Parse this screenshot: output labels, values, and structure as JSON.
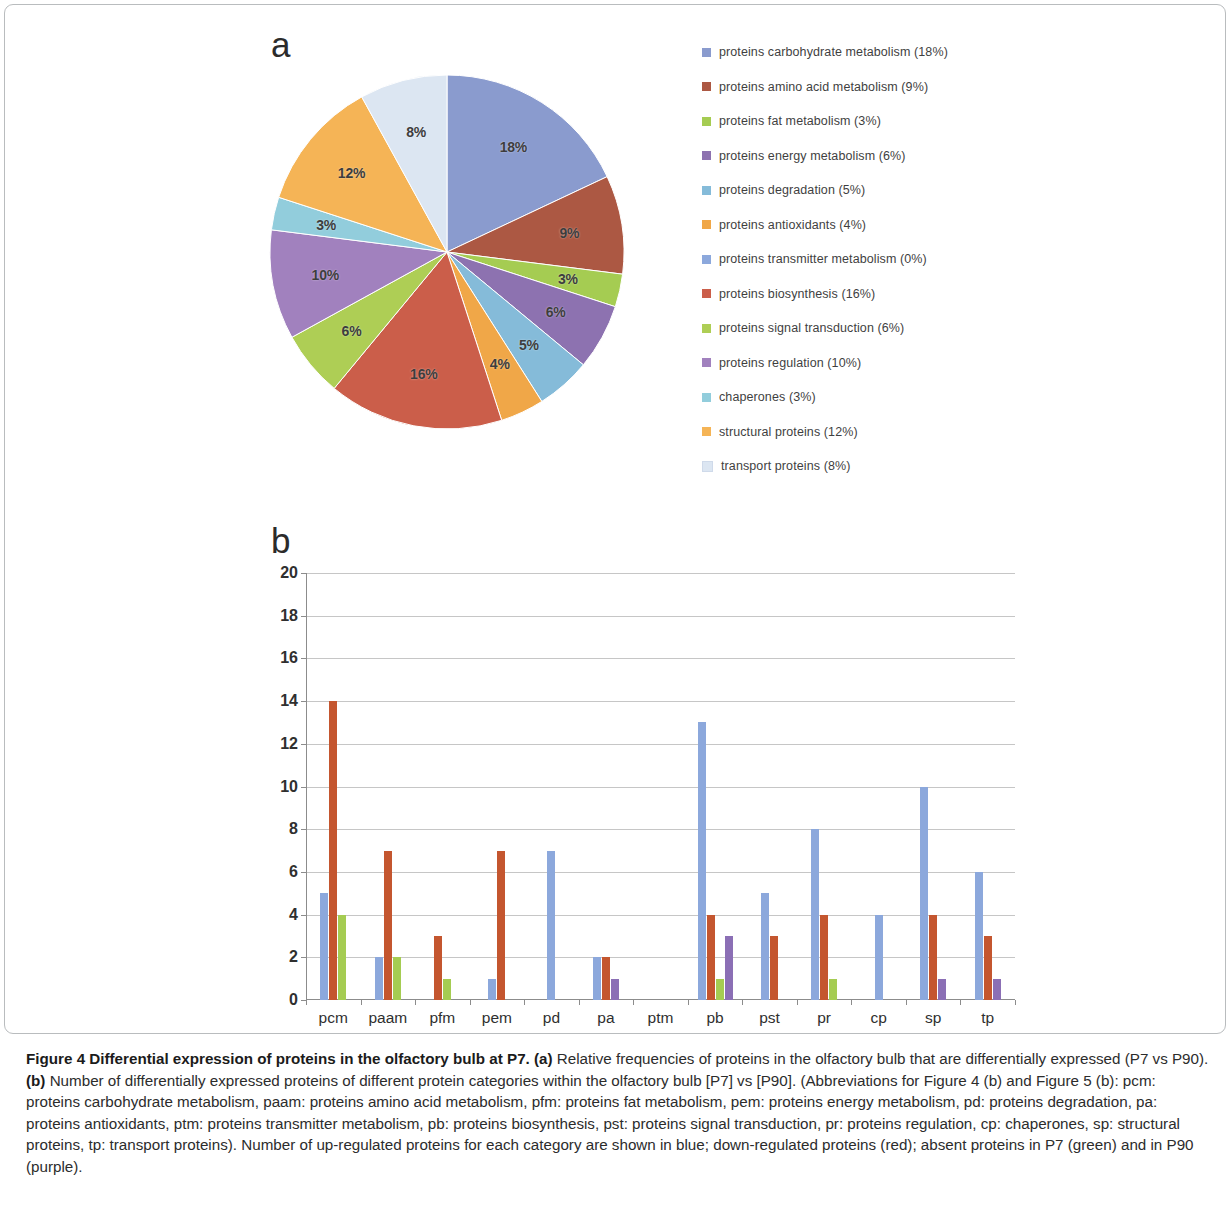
{
  "figure": {
    "panel_a_letter": "a",
    "panel_b_letter": "b",
    "caption_title": "Figure 4 Differential expression of proteins in the olfactory bulb at P7.",
    "caption_a_tag": "(a)",
    "caption_a_text": " Relative frequencies of proteins in the olfactory bulb that are differentially expressed (P7 vs P90). ",
    "caption_b_tag": "(b)",
    "caption_b_text": " Number of differentially expressed proteins of different protein categories within the olfactory bulb [P7] vs [P90]. (Abbreviations for Figure 4 (b) and Figure 5 (b): pcm: proteins carbohydrate metabolism, paam: proteins amino acid metabolism, pfm: proteins fat metabolism, pem: proteins energy metabolism, pd: proteins degradation, pa: proteins antioxidants, ptm: proteins transmitter metabolism, pb: proteins biosynthesis, pst: proteins signal transduction, pr: proteins regulation, cp: chaperones, sp: structural proteins, tp: transport proteins). Number of up-regulated proteins for each category are shown in blue; down-regulated proteins (red); absent proteins in P7 (green) and in P90 (purple)."
  },
  "colors": {
    "series_up_blue": "#8CA8DC",
    "series_down_red": "#C4562F",
    "series_absent_p7_green": "#A5CC52",
    "series_absent_p90_purple": "#8B6FB5",
    "pie_carbohydrate": "#8A9BCE",
    "pie_amino_acid": "#AC5843",
    "pie_fat": "#A5CC52",
    "pie_energy": "#8D72B0",
    "pie_degradation": "#85BBD9",
    "pie_antioxidants": "#F0A748",
    "pie_transmitter": "#8CA8DC",
    "pie_biosynthesis": "#CB5E4A",
    "pie_signal": "#AECE55",
    "pie_regulation": "#A181BE",
    "pie_chaperones": "#92CDDC",
    "pie_structural": "#F5B456",
    "pie_transport": "#DCE6F2"
  },
  "chart_data": [
    {
      "type": "pie",
      "title": "Relative frequencies of differentially expressed proteins (P7 vs P90)",
      "labels": [
        "proteins carbohydrate metabolism",
        "proteins amino acid metabolism",
        "proteins fat metabolism",
        "proteins energy metabolism",
        "proteins degradation",
        "proteins antioxidants",
        "proteins transmitter metabolism",
        "proteins biosynthesis",
        "proteins signal transduction",
        "proteins regulation",
        "chaperones",
        "structural proteins",
        "transport proteins"
      ],
      "values": [
        18,
        9,
        3,
        6,
        5,
        4,
        0,
        16,
        6,
        10,
        3,
        12,
        8
      ],
      "slice_labels": [
        "18%",
        "9%",
        "3%",
        "6%",
        "5%",
        "4%",
        "",
        "16%",
        "6%",
        "10%",
        "3%",
        "12%",
        "8%"
      ],
      "legend_entries": [
        {
          "label": "proteins carbohydrate metabolism (18%)",
          "color": "#8A9BCE"
        },
        {
          "label": "proteins amino acid metabolism  (9%)",
          "color": "#AC5843"
        },
        {
          "label": "proteins fat metabolism   (3%)",
          "color": "#A5CC52"
        },
        {
          "label": "proteins energy metabolism  (6%)",
          "color": "#8D72B0"
        },
        {
          "label": "proteins degradation  (5%)",
          "color": "#85BBD9"
        },
        {
          "label": "proteins antioxidants  (4%)",
          "color": "#F0A748"
        },
        {
          "label": "proteins transmitter metabolism  (0%)",
          "color": "#8CA8DC"
        },
        {
          "label": "proteins biosynthesis  (16%)",
          "color": "#CB5E4A"
        },
        {
          "label": "proteins signal transduction  (6%)",
          "color": "#AECE55"
        },
        {
          "label": "proteins regulation  (10%)",
          "color": "#A181BE"
        },
        {
          "label": "chaperones  (3%)",
          "color": "#92CDDC"
        },
        {
          "label": "structural proteins  (12%)",
          "color": "#F5B456"
        },
        {
          "label": "transport proteins  (8%)",
          "color": "#DCE6F2"
        }
      ],
      "legend_position": "right",
      "start_angle_deg": 0,
      "direction": "clockwise"
    },
    {
      "type": "bar",
      "title": "Number of differentially expressed proteins per category (P7 vs P90)",
      "xlabel": "",
      "ylabel": "",
      "ylim": [
        0,
        20
      ],
      "ytick_labels": [
        "0",
        "2",
        "4",
        "6",
        "8",
        "10",
        "12",
        "14",
        "16",
        "18",
        "20"
      ],
      "yticks": [
        0,
        2,
        4,
        6,
        8,
        10,
        12,
        14,
        16,
        18,
        20
      ],
      "grid": true,
      "categories": [
        "pcm",
        "paam",
        "pfm",
        "pem",
        "pd",
        "pa",
        "ptm",
        "pb",
        "pst",
        "pr",
        "cp",
        "sp",
        "tp"
      ],
      "series": [
        {
          "name": "up-regulated (blue)",
          "color": "#8CA8DC",
          "values": [
            5,
            2,
            0,
            1,
            7,
            2,
            0,
            13,
            5,
            8,
            4,
            10,
            6
          ]
        },
        {
          "name": "down-regulated (red)",
          "color": "#C4562F",
          "values": [
            14,
            7,
            3,
            7,
            0,
            2,
            0,
            4,
            3,
            4,
            0,
            4,
            3
          ]
        },
        {
          "name": "absent in P7 (green)",
          "color": "#A5CC52",
          "values": [
            4,
            2,
            1,
            0,
            0,
            0,
            0,
            1,
            0,
            1,
            0,
            0,
            0
          ]
        },
        {
          "name": "absent in P90 (purple)",
          "color": "#8B6FB5",
          "values": [
            0,
            0,
            0,
            0,
            0,
            1,
            0,
            3,
            0,
            0,
            0,
            1,
            1
          ]
        }
      ]
    }
  ]
}
